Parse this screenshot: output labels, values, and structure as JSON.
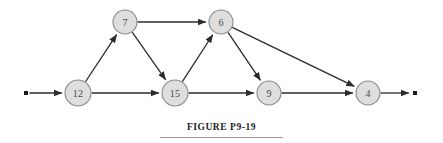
{
  "figure": {
    "caption": "FIGURE P9-19",
    "caption_rule": "horizontal-rule"
  },
  "colors": {
    "node_fill": "#dedede",
    "node_stroke": "#8a8a8a",
    "node_text": "#4a4a4a",
    "edge": "#2b2b2b",
    "terminal": "#1a1a1a",
    "background": "#ffffff",
    "caption_text": "#1c1c1c",
    "caption_rule": "#9a9a9a"
  },
  "chart_data": {
    "type": "diagram",
    "subtype": "directed-network-graph",
    "title": "FIGURE P9-19",
    "nodes": [
      {
        "id": "n12",
        "label": "12",
        "x": 78,
        "y": 93,
        "r": 13
      },
      {
        "id": "n7",
        "label": "7",
        "x": 125,
        "y": 22,
        "r": 12
      },
      {
        "id": "n15",
        "label": "15",
        "x": 175,
        "y": 93,
        "r": 13
      },
      {
        "id": "n6",
        "label": "6",
        "x": 221,
        "y": 22,
        "r": 12
      },
      {
        "id": "n9",
        "label": "9",
        "x": 269,
        "y": 93,
        "r": 12
      },
      {
        "id": "n4",
        "label": "4",
        "x": 368,
        "y": 93,
        "r": 12
      }
    ],
    "terminals": [
      {
        "id": "t_start",
        "x": 26,
        "y": 93,
        "size": 4
      },
      {
        "id": "t_end",
        "x": 415,
        "y": 93,
        "size": 4
      }
    ],
    "edges": [
      {
        "from": "t_start",
        "to": "n12",
        "arrow": true
      },
      {
        "from": "n12",
        "to": "n7",
        "arrow": true
      },
      {
        "from": "n12",
        "to": "n15",
        "arrow": true
      },
      {
        "from": "n7",
        "to": "n6",
        "arrow": true
      },
      {
        "from": "n7",
        "to": "n15",
        "arrow": true
      },
      {
        "from": "n15",
        "to": "n6",
        "arrow": true
      },
      {
        "from": "n15",
        "to": "n9",
        "arrow": true
      },
      {
        "from": "n6",
        "to": "n9",
        "arrow": true
      },
      {
        "from": "n6",
        "to": "n4",
        "arrow": true
      },
      {
        "from": "n9",
        "to": "n4",
        "arrow": true
      },
      {
        "from": "n4",
        "to": "t_end",
        "arrow": true
      }
    ]
  }
}
